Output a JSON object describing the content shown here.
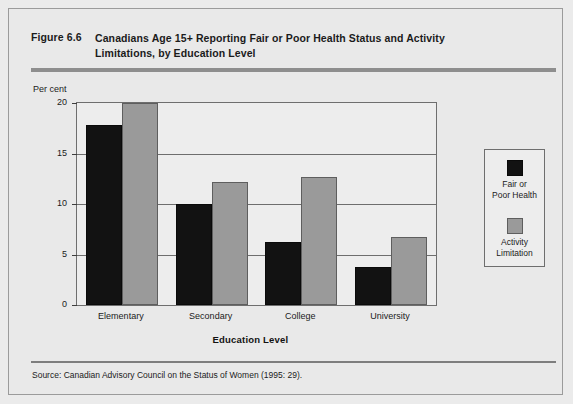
{
  "figure": {
    "number": "Figure 6.6",
    "title": "Canadians Age 15+ Reporting Fair or Poor Health Status and Activity Limitations, by Education Level",
    "source": "Source:  Canadian Advisory Council on the Status of Women (1995: 29)."
  },
  "chart_data": {
    "type": "bar",
    "title": "Canadians Age 15+ Reporting Fair or Poor Health Status and Activity Limitations, by Education Level",
    "xlabel": "Education Level",
    "ylabel": "Per cent",
    "ylim": [
      0,
      20
    ],
    "yticks": [
      0,
      5,
      10,
      15,
      20
    ],
    "ytick_labels": [
      "0",
      "5",
      "10",
      "15",
      "20"
    ],
    "grid": true,
    "legend_position": "right-outside",
    "categories": [
      "Elementary",
      "Secondary",
      "College",
      "University"
    ],
    "series": [
      {
        "name": "Fair or Poor Health",
        "color": "#121212",
        "values": [
          17.8,
          10.0,
          6.2,
          3.8
        ]
      },
      {
        "name": "Activity Limitation",
        "color": "#9a9a9a",
        "values": [
          20.0,
          12.2,
          12.7,
          6.7
        ],
        "notes": "Elementary bar is clipped at the top of the 20 per cent axis"
      }
    ]
  },
  "legend": {
    "entries": [
      {
        "label_line1": "Fair or",
        "label_line2": "Poor Health",
        "swatch": "dark-swatch"
      },
      {
        "label_line1": "Activity",
        "label_line2": "Limitation",
        "swatch": "gray-swatch"
      }
    ]
  }
}
